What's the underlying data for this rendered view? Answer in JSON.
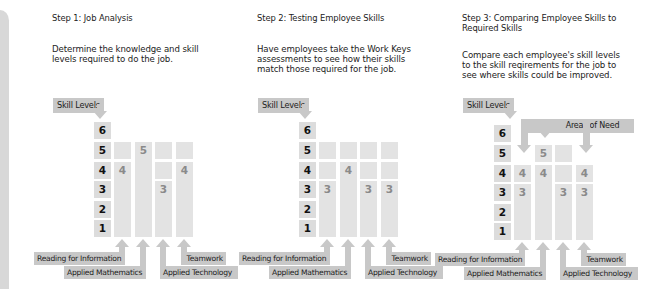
{
  "steps": [
    {
      "title": "Step 1: Job Analysis",
      "description_lines": [
        "Determine the knowledge and skill",
        "levels required to do the job."
      ],
      "skill_levels_label": "Skill Levels",
      "levels": [
        "6",
        "5",
        "4",
        "3",
        "2",
        "1"
      ],
      "columns": [
        {
          "skill": "Reading for Information",
          "value": "4"
        },
        {
          "skill": "Applied Mathematics",
          "value": "5"
        },
        {
          "skill": "Applied Technology",
          "value": "3"
        },
        {
          "skill": "Teamwork",
          "value": "4"
        }
      ]
    },
    {
      "title": "Step 2: Testing Employee Skills",
      "description_lines": [
        "Have employees take the Work Keys",
        "assessments to see how their skills",
        "match those required for the job."
      ],
      "skill_levels_label": "Skill Levels",
      "levels": [
        "6",
        "5",
        "4",
        "3",
        "2",
        "1"
      ],
      "columns": [
        {
          "skill": "Reading for Information",
          "value": "3"
        },
        {
          "skill": "Applied Mathematics",
          "value": "4"
        },
        {
          "skill": "Applied Technology",
          "value": "3"
        },
        {
          "skill": "Teamwork",
          "value": "3"
        }
      ]
    },
    {
      "title_lines": [
        "Step 3: Comparing Employee Skills to",
        "Required Skills"
      ],
      "description_lines": [
        "Compare each employee's skill levels",
        "to the skill reqirements for the job to",
        "see where skills could be improved."
      ],
      "skill_levels_label": "Skill Levels",
      "areas_of_need_label": "Areas of Need",
      "levels": [
        "6",
        "5",
        "4",
        "3",
        "2",
        "1"
      ],
      "columns": [
        {
          "skill": "Reading for Information",
          "required": "4",
          "employee": "3"
        },
        {
          "skill": "Applied Mathematics",
          "required": "5",
          "employee": "4"
        },
        {
          "skill": "Applied Technology",
          "required": "3",
          "employee": "3"
        },
        {
          "skill": "Teamwork",
          "required": "4",
          "employee": "3"
        }
      ]
    }
  ],
  "colors": {
    "label_gray": "#c8c8c8",
    "cell_gray": "#e3e3e3",
    "level_gray": "#dcdcdc",
    "value_text": "#8a8a8a"
  }
}
